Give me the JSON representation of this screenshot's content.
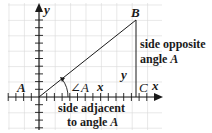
{
  "diagram": {
    "type": "right-triangle-on-coordinate-plane",
    "axes": {
      "x_label": "x",
      "y_label": "y"
    },
    "vertices": {
      "A": {
        "label": "A",
        "coords": [
          0,
          0
        ]
      },
      "B": {
        "label": "B",
        "coords": [
          6.5,
          5
        ]
      },
      "C": {
        "label": "C",
        "coords": [
          6.5,
          0
        ]
      }
    },
    "angle_label": "∠A",
    "side_labels": {
      "horizontal_leg": "x",
      "vertical_leg": "y",
      "opposite_line1": "side opposite",
      "opposite_line2_prefix": "angle ",
      "opposite_line2_var": "A",
      "adjacent_line1": "side adjacent",
      "adjacent_line2_prefix": "to angle ",
      "adjacent_line2_var": "A"
    },
    "colors": {
      "grid": "#d9d9d9",
      "lines": "#1a1a1a",
      "background": "#ffffff"
    }
  }
}
